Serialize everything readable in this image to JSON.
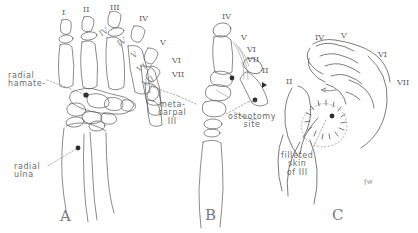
{
  "figure": {
    "background_color": "#ffffff",
    "ink_color": "#4a4a4a",
    "label_color": "#6b6b6b",
    "signature": "fw"
  },
  "panels": [
    {
      "letter": "A",
      "caption": "A",
      "view": "dorsal skeletal hand, bones outlined",
      "labels": [
        {
          "text": "radial\nhamate-",
          "x": 8,
          "y": 72
        },
        {
          "text": "radial\nulna",
          "x": 14,
          "y": 163
        }
      ],
      "digit_numerals": [
        {
          "text": "I",
          "x": 62,
          "y": 8,
          "size": 8,
          "rot": 0
        },
        {
          "text": "II",
          "x": 83,
          "y": 5,
          "size": 8,
          "rot": 0
        },
        {
          "text": "III",
          "x": 110,
          "y": 3,
          "size": 8,
          "rot": 0
        },
        {
          "text": "IV",
          "x": 139,
          "y": 14,
          "size": 8,
          "rot": 0
        },
        {
          "text": "V",
          "x": 160,
          "y": 38,
          "size": 8,
          "rot": 0
        },
        {
          "text": "VI",
          "x": 172,
          "y": 56,
          "size": 8,
          "rot": 0
        },
        {
          "text": "VII",
          "x": 172,
          "y": 70,
          "size": 8,
          "rot": 0
        }
      ],
      "slant_marks": [
        {
          "text": "IV",
          "x": 100,
          "y": 30,
          "rot": -32
        },
        {
          "text": "IV",
          "x": 118,
          "y": 40,
          "rot": -32
        },
        {
          "text": "V",
          "x": 132,
          "y": 52,
          "rot": -32
        },
        {
          "text": "VI",
          "x": 138,
          "y": 66,
          "rot": -32
        },
        {
          "text": "VII",
          "x": 143,
          "y": 80,
          "rot": -32
        }
      ]
    },
    {
      "letter": "B",
      "caption": "B",
      "view": "metacarpal osteotomy detail",
      "labels": [
        {
          "text": "meta-\ncarpal\nIII",
          "x": 158,
          "y": 101
        },
        {
          "text": "osteotomy\nsite",
          "x": 228,
          "y": 113
        }
      ],
      "digit_numerals": [
        {
          "text": "IV",
          "x": 222,
          "y": 12,
          "size": 8,
          "rot": 0
        },
        {
          "text": "V",
          "x": 241,
          "y": 33,
          "size": 8,
          "rot": 0
        },
        {
          "text": "VI",
          "x": 247,
          "y": 45,
          "size": 8,
          "rot": 0
        },
        {
          "text": "VII",
          "x": 247,
          "y": 55,
          "size": 8,
          "rot": 0
        },
        {
          "text": "II",
          "x": 262,
          "y": 66,
          "size": 8,
          "rot": 0
        }
      ]
    },
    {
      "letter": "C",
      "caption": "C",
      "view": "soft tissue hand with filleted skin flap",
      "labels": [
        {
          "text": "filleted\nskin\nof III",
          "x": 281,
          "y": 152
        }
      ],
      "digit_numerals": [
        {
          "text": "IV",
          "x": 315,
          "y": 33,
          "size": 8,
          "rot": 0
        },
        {
          "text": "V",
          "x": 341,
          "y": 31,
          "size": 8,
          "rot": 0
        },
        {
          "text": "VI",
          "x": 378,
          "y": 50,
          "size": 8,
          "rot": 0
        },
        {
          "text": "VII",
          "x": 397,
          "y": 78,
          "size": 8,
          "rot": 0
        },
        {
          "text": "II",
          "x": 286,
          "y": 77,
          "size": 8,
          "rot": 0
        }
      ]
    }
  ],
  "panel_letters": [
    {
      "text": "A",
      "x": 60,
      "y": 207
    },
    {
      "text": "B",
      "x": 205,
      "y": 206
    },
    {
      "text": "C",
      "x": 332,
      "y": 206
    }
  ]
}
